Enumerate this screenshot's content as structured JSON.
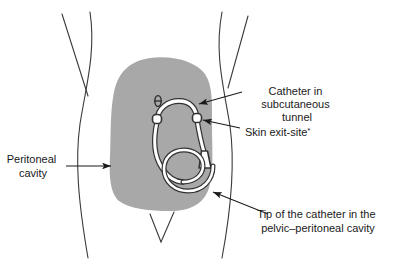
{
  "figure": {
    "colors": {
      "abdomen_fill": "#a8a8a8",
      "body_outline": "#3a3a3a",
      "catheter_fill": "#ffffff",
      "catheter_outline": "#333333",
      "text": "#1a1a1a",
      "background": "#ffffff"
    },
    "anatomy": {
      "abdomen_region_name": "peritoneal cavity shading",
      "umbilicus_name": "umbilicus",
      "groin_crease_name": "groin crease"
    },
    "device": {
      "catheter_name": "peritoneal dialysis catheter",
      "deep_cuff_name": "deep cuff",
      "superficial_cuff_name": "superficial cuff",
      "coiled_tip_name": "coiled catheter tip",
      "exit_tip_name": "external catheter connector"
    }
  },
  "labels": [
    {
      "id": "catheter-tunnel",
      "lines": [
        "Catheter in",
        "subcutaneous",
        "tunnel"
      ],
      "align": "middle",
      "target": "catheter arch in subcutaneous tunnel"
    },
    {
      "id": "skin-exit-site",
      "lines": [
        "Skin exit-site"
      ],
      "suffix": "*",
      "align": "start",
      "target": "superficial cuff at skin exit site"
    },
    {
      "id": "peritoneal-cavity",
      "lines": [
        "Peritoneal",
        "cavity"
      ],
      "align": "middle",
      "target": "shaded peritoneal cavity"
    },
    {
      "id": "catheter-tip",
      "lines": [
        "Tip of the catheter in the",
        "pelvic–peritoneal cavity"
      ],
      "align": "middle",
      "target": "coiled catheter tip in pelvis"
    }
  ]
}
